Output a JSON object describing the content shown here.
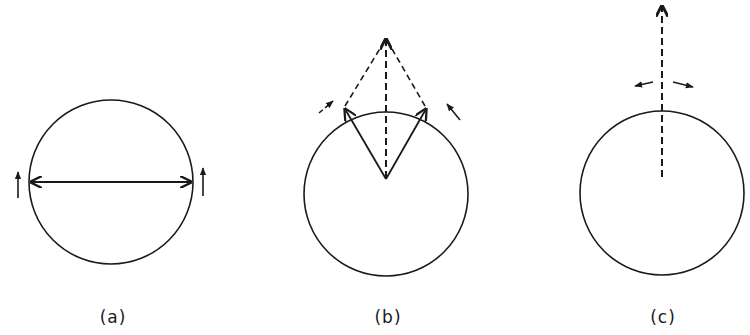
{
  "figure": {
    "panels": [
      {
        "id": "a",
        "label": "(a)",
        "description": "Circle with a horizontal double-headed diameter arrow; small upward arrows at both ends",
        "circle": {
          "cx": 111,
          "cy": 182,
          "r": 82
        }
      },
      {
        "id": "b",
        "label": "(b)",
        "description": "Circle with two solid arrows from center to rim points; dashed lines from those points meet at an apex above, plus dashed resultant from center to apex; small tangential arrows",
        "circle": {
          "cx": 386,
          "cy": 194,
          "r": 82
        }
      },
      {
        "id": "c",
        "label": "(c)",
        "description": "Circle with a single dashed vertical arrow from center upward past the rim; small outward-pointing arrows near the top",
        "circle": {
          "cx": 662,
          "cy": 193,
          "r": 82
        }
      }
    ],
    "colors": {
      "stroke": "#1a1a1a",
      "background": "#ffffff"
    }
  }
}
